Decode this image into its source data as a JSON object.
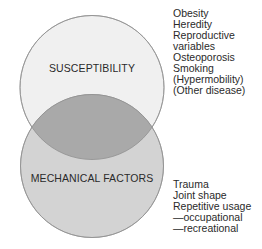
{
  "diagram": {
    "type": "venn",
    "circles": [
      {
        "id": "susceptibility",
        "label": "SUSCEPTIBILITY",
        "fill": "#f0f0f0",
        "factors": [
          "Obesity",
          "Heredity",
          "Reproductive",
          "variables",
          "Osteoporosis",
          "Smoking",
          "(Hypermobility)",
          "(Other disease)"
        ]
      },
      {
        "id": "mechanical",
        "label": "MECHANICAL FACTORS",
        "fill": "#d3d3d3",
        "factors": [
          "Trauma",
          "Joint shape",
          "Repetitive usage",
          "—occupational",
          "—recreational"
        ]
      }
    ],
    "intersection_fill": "#a9a9a9",
    "stroke": "#9a9a9a"
  }
}
